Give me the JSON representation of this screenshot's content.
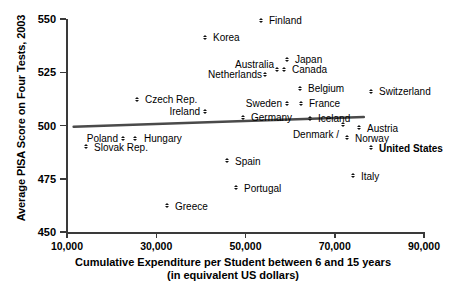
{
  "chart_data": {
    "type": "scatter",
    "title": "",
    "xlabel": "Cumulative Expenditure per Student between 6 and 15 years (in equivalent US dollars)",
    "xlabel_line1": "Cumulative Expenditure per Student between 6 and 15 years",
    "xlabel_line2": "(in equivalent US dollars)",
    "ylabel": "Average PISA Score on Four Tests, 2003",
    "xlim": [
      6000,
      92000
    ],
    "ylim": [
      450,
      550
    ],
    "xticks": [
      10000,
      30000,
      50000,
      70000,
      90000
    ],
    "xticklabels": [
      "10,000",
      "30,000",
      "50,000",
      "70,000",
      "90,000"
    ],
    "yticks": [
      450,
      475,
      500,
      525,
      550
    ],
    "yticklabels": [
      "450",
      "475",
      "500",
      "525",
      "550"
    ],
    "grid": false,
    "legend": "none",
    "marker": "diamond",
    "marker_color": "#111111",
    "trendline": {
      "shown": true,
      "color": "#4a4a4a",
      "x_start": 11500,
      "y_start": 499.4,
      "x_end": 76500,
      "y_end": 504.0
    },
    "points": [
      {
        "label": "Finland",
        "x": 54500,
        "y": 541.0,
        "px": 262,
        "py": 21,
        "lx": 269,
        "ly": 16,
        "bold": false,
        "anchor": "left"
      },
      {
        "label": "Korea",
        "x": 42000,
        "y": 533.0,
        "px": 206,
        "py": 38,
        "lx": 213,
        "ly": 33,
        "bold": false,
        "anchor": "left"
      },
      {
        "label": "Japan",
        "x": 60000,
        "y": 522.5,
        "px": 288,
        "py": 60,
        "lx": 295,
        "ly": 55,
        "bold": false,
        "anchor": "left"
      },
      {
        "label": "Australia",
        "x": 57800,
        "y": 517.5,
        "px": 278,
        "py": 70,
        "lx": 274,
        "ly": 60,
        "bold": false,
        "anchor": "right"
      },
      {
        "label": "Canada",
        "x": 59400,
        "y": 517.5,
        "px": 285,
        "py": 70,
        "lx": 292,
        "ly": 65,
        "bold": false,
        "anchor": "left"
      },
      {
        "label": "Netherlands",
        "x": 55300,
        "y": 515.0,
        "px": 266,
        "py": 75,
        "lx": 262,
        "ly": 70,
        "bold": false,
        "anchor": "right"
      },
      {
        "label": "Belgium",
        "x": 62900,
        "y": 508.5,
        "px": 301,
        "py": 89,
        "lx": 308,
        "ly": 84,
        "bold": false,
        "anchor": "left"
      },
      {
        "label": "Switzerland",
        "x": 78200,
        "y": 507.5,
        "px": 372,
        "py": 92,
        "lx": 379,
        "ly": 87,
        "bold": false,
        "anchor": "left"
      },
      {
        "label": "Czech Rep.",
        "x": 25600,
        "y": 509.5,
        "px": 138,
        "py": 100,
        "lx": 145,
        "ly": 95,
        "bold": false,
        "anchor": "left"
      },
      {
        "label": "Sweden",
        "x": 60000,
        "y": 505.0,
        "px": 288,
        "py": 104,
        "lx": 282,
        "ly": 99,
        "bold": false,
        "anchor": "right"
      },
      {
        "label": "France",
        "x": 63200,
        "y": 505.0,
        "px": 302,
        "py": 104,
        "lx": 309,
        "ly": 99,
        "bold": false,
        "anchor": "left"
      },
      {
        "label": "Ireland",
        "x": 41500,
        "y": 503.5,
        "px": 206,
        "py": 112,
        "lx": 200,
        "ly": 107,
        "bold": false,
        "anchor": "right"
      },
      {
        "label": "Germany",
        "x": 50000,
        "y": 500.5,
        "px": 244,
        "py": 118,
        "lx": 251,
        "ly": 113,
        "bold": false,
        "anchor": "left"
      },
      {
        "label": "Iceland",
        "x": 65400,
        "y": 500.5,
        "px": 311,
        "py": 119,
        "lx": 318,
        "ly": 114,
        "bold": false,
        "anchor": "left"
      },
      {
        "label": "Denmark /",
        "x": 72800,
        "y": 497.5,
        "px": 344,
        "py": 125,
        "lx": 339,
        "ly": 130,
        "bold": false,
        "anchor": "right"
      },
      {
        "label": "Austria",
        "x": 76300,
        "y": 496.0,
        "px": 360,
        "py": 128,
        "lx": 367,
        "ly": 124,
        "bold": false,
        "anchor": "left"
      },
      {
        "label": "Norway",
        "x": 73700,
        "y": 493.5,
        "px": 348,
        "py": 138,
        "lx": 355,
        "ly": 134,
        "bold": false,
        "anchor": "left"
      },
      {
        "label": "Poland",
        "x": 22800,
        "y": 493.5,
        "px": 124,
        "py": 139,
        "lx": 118,
        "ly": 134,
        "bold": false,
        "anchor": "right"
      },
      {
        "label": "Hungary",
        "x": 25400,
        "y": 493.5,
        "px": 136,
        "py": 139,
        "lx": 144,
        "ly": 134,
        "bold": false,
        "anchor": "left"
      },
      {
        "label": "United States",
        "x": 79000,
        "y": 489.0,
        "px": 372,
        "py": 148,
        "lx": 379,
        "ly": 144,
        "bold": true,
        "anchor": "left"
      },
      {
        "label": "Slovak Rep.",
        "x": 14700,
        "y": 489.5,
        "px": 87,
        "py": 147,
        "lx": 94,
        "ly": 143,
        "bold": false,
        "anchor": "left"
      },
      {
        "label": "Spain",
        "x": 46600,
        "y": 482.5,
        "px": 228,
        "py": 161,
        "lx": 235,
        "ly": 157,
        "bold": false,
        "anchor": "left"
      },
      {
        "label": "Italy",
        "x": 74900,
        "y": 475.5,
        "px": 354,
        "py": 176,
        "lx": 361,
        "ly": 172,
        "bold": false,
        "anchor": "left"
      },
      {
        "label": "Portugal",
        "x": 48700,
        "y": 470.0,
        "px": 237,
        "py": 188,
        "lx": 244,
        "ly": 184,
        "bold": false,
        "anchor": "left"
      },
      {
        "label": "Greece",
        "x": 31600,
        "y": 461.5,
        "px": 168,
        "py": 206,
        "lx": 175,
        "ly": 202,
        "bold": false,
        "anchor": "left"
      }
    ]
  }
}
